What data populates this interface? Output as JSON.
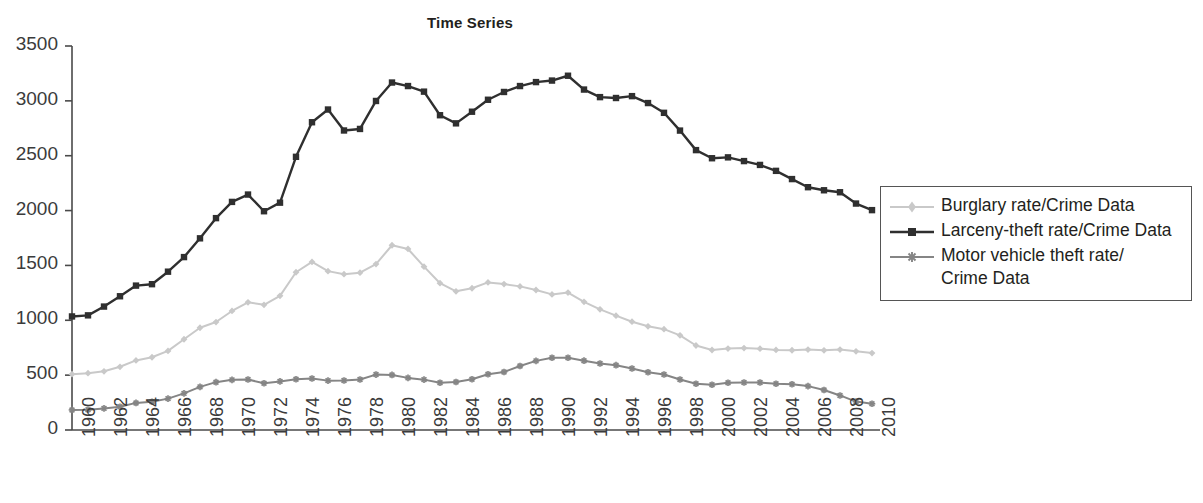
{
  "chart_data": {
    "type": "line",
    "title": "Time Series",
    "xlabel": "",
    "ylabel": "",
    "xlim": [
      1960,
      2010
    ],
    "ylim": [
      0,
      3500
    ],
    "grid": false,
    "legend_position": "right",
    "x": [
      1960,
      1961,
      1962,
      1963,
      1964,
      1965,
      1966,
      1967,
      1968,
      1969,
      1970,
      1971,
      1972,
      1973,
      1974,
      1975,
      1976,
      1977,
      1978,
      1979,
      1980,
      1981,
      1982,
      1983,
      1984,
      1985,
      1986,
      1987,
      1988,
      1989,
      1990,
      1991,
      1992,
      1993,
      1994,
      1995,
      1996,
      1997,
      1998,
      1999,
      2000,
      2001,
      2002,
      2003,
      2004,
      2005,
      2006,
      2007,
      2008,
      2009,
      2010
    ],
    "x_tick_labels": [
      "1960",
      "1962",
      "1964",
      "1966",
      "1968",
      "1970",
      "1972",
      "1974",
      "1976",
      "1978",
      "1980",
      "1982",
      "1984",
      "1986",
      "1988",
      "1990",
      "1992",
      "1994",
      "1996",
      "1998",
      "2000",
      "2002",
      "2004",
      "2006",
      "2008",
      "2010"
    ],
    "y_tick_labels": [
      "0",
      "500",
      "1000",
      "1500",
      "2000",
      "2500",
      "3000",
      "3500"
    ],
    "y_ticks": [
      0,
      500,
      1000,
      1500,
      2000,
      2500,
      3000,
      3500
    ],
    "series": [
      {
        "name": "Burglary rate/Crime Data",
        "color": "#c9c9c9",
        "marker": "diamond",
        "values": [
          509,
          518,
          535,
          576,
          634,
          663,
          721,
          827,
          932,
          984,
          1085,
          1164,
          1141,
          1223,
          1438,
          1532,
          1448,
          1420,
          1434,
          1512,
          1684,
          1650,
          1489,
          1338,
          1264,
          1292,
          1345,
          1330,
          1309,
          1276,
          1236,
          1253,
          1168,
          1100,
          1042,
          987,
          945,
          919,
          863,
          770,
          729,
          742,
          747,
          741,
          730,
          727,
          733,
          726,
          733,
          717,
          701
        ]
      },
      {
        "name": "Larceny-theft rate/Crime Data",
        "color": "#2f2f2f",
        "marker": "square",
        "values": [
          1035,
          1045,
          1125,
          1219,
          1316,
          1329,
          1443,
          1576,
          1747,
          1931,
          2079,
          2146,
          1994,
          2072,
          2490,
          2805,
          2921,
          2730,
          2744,
          2999,
          3167,
          3135,
          3084,
          2869,
          2795,
          2901,
          3010,
          3081,
          3135,
          3171,
          3185,
          3229,
          3103,
          3034,
          3026,
          3043,
          2980,
          2891,
          2729,
          2551,
          2477,
          2485,
          2451,
          2416,
          2362,
          2287,
          2213,
          2185,
          2167,
          2064,
          2004
        ]
      },
      {
        "name": "Motor vehicle theft rate/ Crime Data",
        "color": "#858585",
        "marker": "star",
        "values": [
          183,
          184,
          197,
          212,
          247,
          257,
          286,
          334,
          393,
          436,
          457,
          460,
          426,
          443,
          462,
          469,
          450,
          451,
          460,
          505,
          502,
          475,
          459,
          431,
          437,
          463,
          508,
          529,
          583,
          630,
          658,
          659,
          632,
          606,
          591,
          561,
          526,
          506,
          460,
          422,
          412,
          431,
          433,
          433,
          422,
          417,
          400,
          364,
          315,
          259,
          239
        ]
      }
    ]
  },
  "axes": {
    "plot_left_px": 72,
    "plot_right_px": 872,
    "plot_top_px": 46,
    "plot_bottom_px": 430
  },
  "legend": {
    "items": [
      {
        "label": "Burglary rate/Crime Data",
        "color": "#c9c9c9",
        "marker": "diamond"
      },
      {
        "label": "Larceny-theft rate/Crime Data",
        "color": "#2f2f2f",
        "marker": "square"
      },
      {
        "label_line1": "Motor vehicle theft rate/",
        "label_line2": "Crime Data",
        "color": "#858585",
        "marker": "star"
      }
    ]
  }
}
